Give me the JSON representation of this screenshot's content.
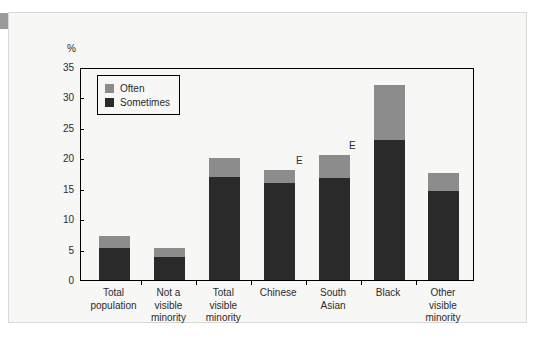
{
  "panel": {
    "corner_tab_color": "#9a9a9a",
    "background_color": "#f7f7f5"
  },
  "chart_data": {
    "type": "bar",
    "subtype": "stacked",
    "title": "",
    "xlabel": "",
    "ylabel": "%",
    "ylim": [
      0,
      35
    ],
    "ytick_step": 5,
    "yticks": [
      "35",
      "30",
      "25",
      "20",
      "15",
      "10",
      "5",
      "0"
    ],
    "grid": false,
    "legend_position": "top-left-inside",
    "categories": [
      "Total population",
      "Not a visible minority",
      "Total visible minority",
      "Chinese",
      "South Asian",
      "Black",
      "Other visible minority"
    ],
    "category_lines": [
      [
        "Total",
        "population"
      ],
      [
        "Not a",
        "visible",
        "minority"
      ],
      [
        "Total",
        "visible",
        "minority"
      ],
      [
        "Chinese"
      ],
      [
        "South",
        "Asian"
      ],
      [
        "Black"
      ],
      [
        "Other",
        "visible",
        "minority"
      ]
    ],
    "series": [
      {
        "name": "Sometimes",
        "color": "#2a2a2a",
        "values": [
          5.3,
          3.8,
          17.0,
          16.0,
          16.7,
          23.0,
          14.7
        ]
      },
      {
        "name": "Often",
        "color": "#8c8c8c",
        "values": [
          1.9,
          1.4,
          3.0,
          2.0,
          3.9,
          9.0,
          2.9
        ]
      }
    ],
    "totals": [
      7.2,
      5.2,
      20.0,
      18.0,
      20.6,
      32.0,
      17.6
    ],
    "annotations": [
      {
        "text": "E",
        "category": "Chinese",
        "note": "use with caution"
      },
      {
        "text": "E",
        "category": "South Asian",
        "note": "use with caution"
      }
    ]
  },
  "legend": {
    "items": [
      {
        "label": "Often",
        "color": "#8c8c8c"
      },
      {
        "label": "Sometimes",
        "color": "#2a2a2a"
      }
    ]
  }
}
